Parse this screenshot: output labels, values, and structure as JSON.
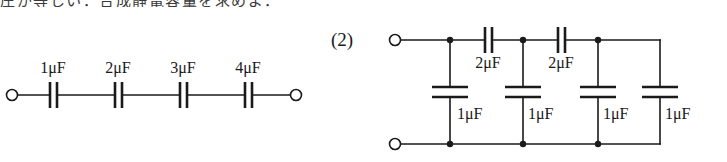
{
  "page": {
    "width": 727,
    "height": 162,
    "background": "#ffffff",
    "ink": "#1a1a1a",
    "cut_off_text_line": "圧が等しい．合成静電容量を求めよ．"
  },
  "figures": [
    {
      "id": "figure-1",
      "kind": "series-capacitor-circuit",
      "number_label": "",
      "terminals": [
        "left-open-terminal",
        "right-open-terminal"
      ],
      "components": [
        {
          "name": "C1",
          "value": "1",
          "unit": "μF",
          "label": "1μF",
          "orientation": "horizontal",
          "cx": 53,
          "cy": 95
        },
        {
          "name": "C2",
          "value": "2",
          "unit": "μF",
          "label": "2μF",
          "orientation": "horizontal",
          "cx": 118,
          "cy": 95
        },
        {
          "name": "C3",
          "value": "3",
          "unit": "μF",
          "label": "3μF",
          "orientation": "horizontal",
          "cx": 183,
          "cy": 95
        },
        {
          "name": "C4",
          "value": "4",
          "unit": "μF",
          "label": "4μF",
          "orientation": "horizontal",
          "cx": 248,
          "cy": 95
        }
      ]
    },
    {
      "id": "figure-2",
      "kind": "ladder-capacitor-network",
      "number_label": "(2)",
      "terminals": [
        "top-left-open-terminal",
        "bottom-left-open-terminal"
      ],
      "series_components": [
        {
          "name": "Cs1",
          "value": "2",
          "unit": "μF",
          "label": "2μF",
          "orientation": "horizontal",
          "cx": 488,
          "cy": 40
        },
        {
          "name": "Cs2",
          "value": "2",
          "unit": "μF",
          "label": "2μF",
          "orientation": "horizontal",
          "cx": 561,
          "cy": 40
        }
      ],
      "shunt_components": [
        {
          "name": "Cp1",
          "value": "1",
          "unit": "μF",
          "label": "1μF",
          "orientation": "vertical",
          "cx": 450,
          "cy": 92
        },
        {
          "name": "Cp2",
          "value": "1",
          "unit": "μF",
          "label": "1μF",
          "orientation": "vertical",
          "cx": 523,
          "cy": 92
        },
        {
          "name": "Cp3",
          "value": "1",
          "unit": "μF",
          "label": "1μF",
          "orientation": "vertical",
          "cx": 598,
          "cy": 92
        },
        {
          "name": "Cp4",
          "value": "1",
          "unit": "μF",
          "label": "1μF",
          "orientation": "vertical",
          "cx": 660,
          "cy": 92
        }
      ]
    }
  ]
}
